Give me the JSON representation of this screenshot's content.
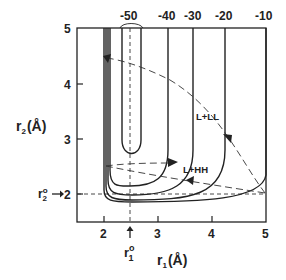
{
  "figure": {
    "type": "potential-energy-contour-diagram",
    "x_axis": {
      "label_main": "r",
      "label_sub": "1",
      "label_unit": "(Å)",
      "ticks": [
        "2",
        "3",
        "4",
        "5"
      ],
      "range": [
        1.5,
        5
      ]
    },
    "y_axis": {
      "label_main": "r",
      "label_sub": "2",
      "label_unit": "(Å)",
      "ticks": [
        "2",
        "3",
        "4",
        "5"
      ],
      "range": [
        1.5,
        5
      ]
    },
    "contour_labels": [
      "-50",
      "-40",
      "-30",
      "-20",
      "-10"
    ],
    "equilibrium": {
      "r1_label_main": "r",
      "r1_label_sup": "o",
      "r1_label_sub": "1",
      "r2_label_main": "r",
      "r2_label_sup": "o",
      "r2_label_sub": "2",
      "r1_value": 2.5,
      "r2_value": 2.0
    },
    "region_labels": {
      "upper": "L+LL",
      "lower": "L+HH"
    }
  }
}
